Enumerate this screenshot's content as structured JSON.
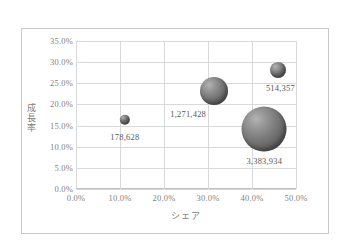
{
  "chart_data": {
    "type": "scatter",
    "subtype": "bubble",
    "title": "",
    "xlabel": "シェア",
    "ylabel": "成長率",
    "xlim": [
      0.0,
      50.0
    ],
    "ylim": [
      0.0,
      35.0
    ],
    "xticks": [
      "0.0%",
      "10.0%",
      "20.0%",
      "30.0%",
      "40.0%",
      "50.0%"
    ],
    "xtick_values": [
      0.0,
      10.0,
      20.0,
      30.0,
      40.0,
      50.0
    ],
    "yticks": [
      "0.0%",
      "5.0%",
      "10.0%",
      "15.0%",
      "20.0%",
      "25.0%",
      "30.0%",
      "35.0%"
    ],
    "ytick_values": [
      0.0,
      5.0,
      10.0,
      15.0,
      20.0,
      25.0,
      30.0,
      35.0
    ],
    "grid": true,
    "legend": "none",
    "points": [
      {
        "label": "178,628",
        "x": 11.1,
        "y": 16.4,
        "size": 178628,
        "radius_px": 5.2,
        "label_dx": 0,
        "label_dy": 12
      },
      {
        "label": "1,271,428",
        "x": 31.4,
        "y": 23.2,
        "size": 1271428,
        "radius_px": 14.0,
        "label_dx": -26,
        "label_dy": 18
      },
      {
        "label": "514,357",
        "x": 46.0,
        "y": 28.2,
        "size": 514357,
        "radius_px": 8.0,
        "label_dx": 2,
        "label_dy": 13
      },
      {
        "label": "3,383,934",
        "x": 42.8,
        "y": 14.3,
        "size": 3383934,
        "radius_px": 22.5,
        "label_dx": 0,
        "label_dy": 27
      }
    ]
  },
  "frame": {
    "border_color": "#c8c8c8",
    "grid_color": "#d9d9d9",
    "axis_color": "#bfbfbf",
    "tick_text_color": "#7f7f7f",
    "label_text_color": "#595959",
    "bubble_color": "#6e6e6e",
    "background": "#ffffff"
  }
}
